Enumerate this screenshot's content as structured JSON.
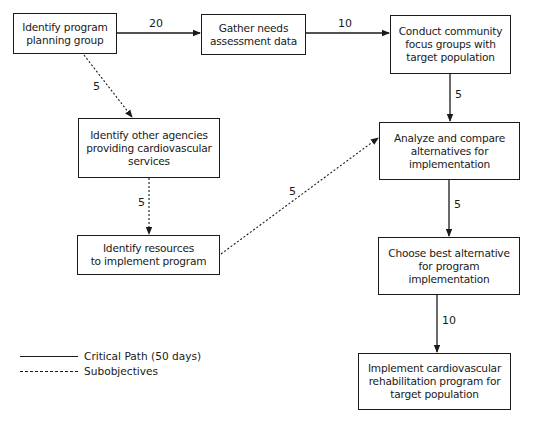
{
  "diagram": {
    "type": "PERT chart",
    "nodes": [
      {
        "id": "n1",
        "label": "Identify program\nplanning group"
      },
      {
        "id": "n2",
        "label": "Gather needs\nassessment data"
      },
      {
        "id": "n3",
        "label": "Conduct community\nfocus groups with\ntarget population"
      },
      {
        "id": "n4",
        "label": "Identify other agencies\nproviding cardiovascular\nservices"
      },
      {
        "id": "n5",
        "label": "Identify resources\nto implement program"
      },
      {
        "id": "n6",
        "label": "Analyze and compare\nalternatives for\nimplementation"
      },
      {
        "id": "n7",
        "label": "Choose best alternative\nfor program\nimplementation"
      },
      {
        "id": "n8",
        "label": "Implement cardiovascular\nrehabilitation program for\ntarget population"
      }
    ],
    "edges": [
      {
        "from": "n1",
        "to": "n2",
        "duration": "20",
        "style": "solid"
      },
      {
        "from": "n2",
        "to": "n3",
        "duration": "10",
        "style": "solid"
      },
      {
        "from": "n3",
        "to": "n6",
        "duration": "5",
        "style": "solid"
      },
      {
        "from": "n6",
        "to": "n7",
        "duration": "5",
        "style": "solid"
      },
      {
        "from": "n7",
        "to": "n8",
        "duration": "10",
        "style": "solid"
      },
      {
        "from": "n1",
        "to": "n4",
        "duration": "5",
        "style": "dotted"
      },
      {
        "from": "n4",
        "to": "n5",
        "duration": "5",
        "style": "dotted"
      },
      {
        "from": "n5",
        "to": "n6",
        "duration": "5",
        "style": "dotted"
      }
    ],
    "legend": {
      "solid": "Critical Path (50 days)",
      "dotted": "Subobjectives"
    },
    "colors": {
      "line": "#1a1a1a",
      "background": "#ffffff"
    }
  }
}
